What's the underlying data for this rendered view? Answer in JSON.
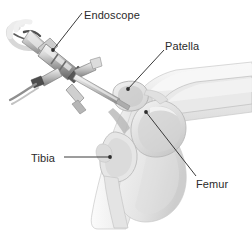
{
  "figure": {
    "background_color": "#ffffff",
    "width": 252,
    "height": 231,
    "style": "grayscale medical line illustration"
  },
  "labels": [
    {
      "id": "endoscope",
      "text": "Endoscope",
      "target": "endoscope instrument body",
      "leader": "diagonal line down-left to scope barrel"
    },
    {
      "id": "patella",
      "text": "Patella",
      "target": "kneecap bone",
      "leader": "diagonal line down-left to patella"
    },
    {
      "id": "tibia",
      "text": "Tibia",
      "target": "shin bone",
      "leader": "horizontal line right to tibia"
    },
    {
      "id": "femur",
      "text": "Femur",
      "target": "thigh bone condyle",
      "leader": "diagonal line up-left to femoral condyle"
    }
  ],
  "colors": {
    "label_text": "#2a2a2a",
    "leader_line": "#3a3a3a",
    "skin_light": "#f2f2f2",
    "skin_mid": "#e4e4e4",
    "skin_shadow": "#d2d2d2",
    "bone_light": "#ededed",
    "bone_mid": "#dcdcdc",
    "joint_dark": "#b9b9b9",
    "outline": "#9a9a9a",
    "metal_light": "#f0f0f0",
    "metal_mid": "#c4c4c4",
    "metal_dark": "#7d7d7d",
    "metal_darkest": "#4a4a4a"
  },
  "anatomy": {
    "parts": [
      "thigh",
      "femur",
      "patella",
      "joint space",
      "tibia",
      "calf"
    ]
  },
  "instrument": {
    "name": "endoscope",
    "parts": [
      "eyepiece cone",
      "light cable",
      "barrel",
      "cross handle",
      "shaft",
      "tip"
    ]
  }
}
